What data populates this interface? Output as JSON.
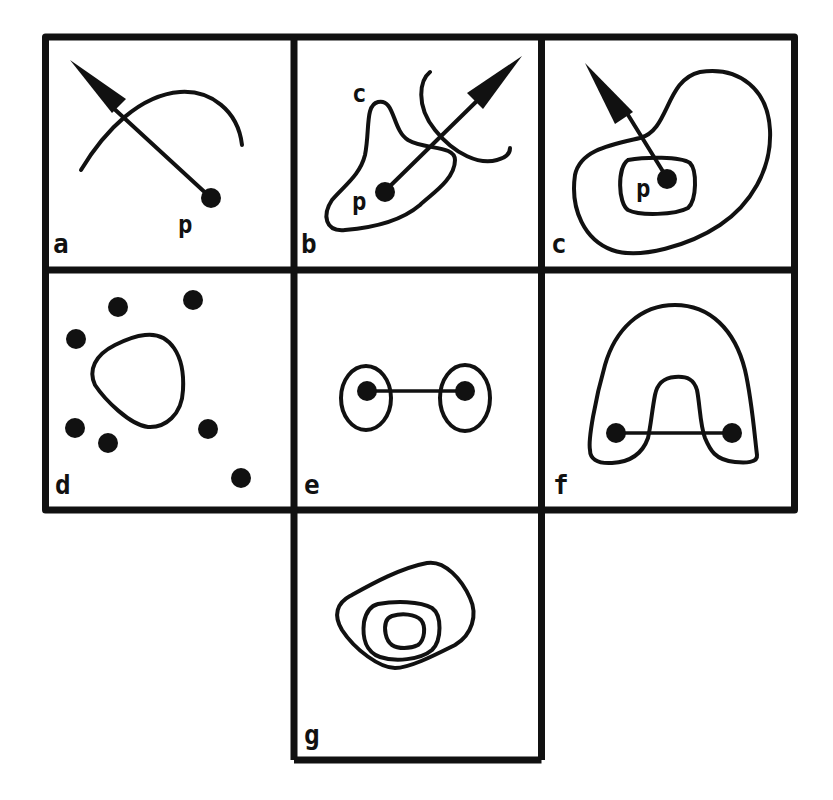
{
  "figure": {
    "stroke_color": "#111111",
    "background_color": "#ffffff",
    "panels": [
      {
        "id": "a",
        "label": "a",
        "description": "point p with arrow crossing an open arc"
      },
      {
        "id": "b",
        "label": "b",
        "description": "point p inside closed curve c, arrow crossing curve c and an open arc"
      },
      {
        "id": "c",
        "label": "c",
        "description": "point p inside small closed curve, inside larger closed curve, arrow pointing outward"
      },
      {
        "id": "d",
        "label": "d",
        "description": "closed curve surrounded by scattered points"
      },
      {
        "id": "e",
        "label": "e",
        "description": "two points each enclosed in an ellipse, connected by a segment"
      },
      {
        "id": "f",
        "label": "f",
        "description": "two points connected by a segment, enclosed in an arch-shaped curve"
      },
      {
        "id": "g",
        "label": "g",
        "description": "three nested closed curves"
      }
    ],
    "point_labels": {
      "a_p": "p",
      "b_p": "p",
      "b_c": "c",
      "c_p": "p"
    }
  }
}
